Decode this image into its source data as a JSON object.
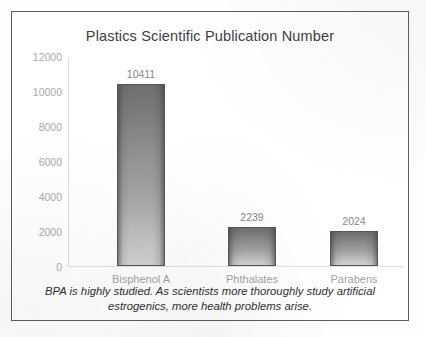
{
  "figure": {
    "border_color": "#5d5d5f",
    "background": "#ffffff"
  },
  "caption": {
    "line1": "BPA is highly studied.  As scientists more thoroughly study artificial",
    "line2": "estrogenics, more health problems arise."
  },
  "chart_data": {
    "type": "bar",
    "title": "Plastics Scientific Publication Number",
    "xlabel": "",
    "ylabel": "",
    "categories": [
      "Bisphenol A",
      "Phthalates",
      "Parabens"
    ],
    "values": [
      10411,
      2239,
      2024
    ],
    "data_labels": [
      "10411",
      "2239",
      "2024"
    ],
    "ylim": [
      0,
      12000
    ],
    "yticks": [
      12000,
      10000,
      8000,
      6000,
      4000,
      2000,
      0
    ],
    "ytick_labels": [
      "12000",
      "10000",
      "8000",
      "6000",
      "4000",
      "2000",
      "0"
    ],
    "grid": false,
    "legend": false,
    "bar_fill_top_color": "#6e6e70",
    "bar_fill_bottom_color": "#d2d2d4",
    "bar_outline_color": "#555558",
    "axis_color": "#dcdcdc",
    "tick_label_color": "#a9a9ab",
    "category_label_color": "#a3a3a6",
    "title_color": "#3e3e3f"
  }
}
